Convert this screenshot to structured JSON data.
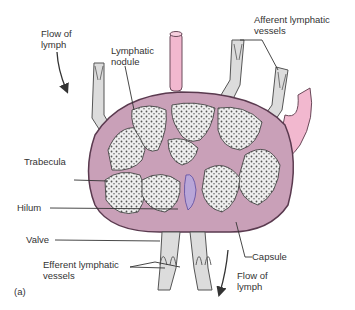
{
  "figure": {
    "panel_label": "(a)",
    "colors": {
      "capsule": "#c9a0b8",
      "capsule_outline": "#5a3a4f",
      "vessel_pink": "#f2b8cf",
      "vessel_gray": "#dcdcdc",
      "nodule_fill": "#eeeeee",
      "nodule_texture": "#444444",
      "vein_blue": "#7a6fc0"
    }
  },
  "labels": {
    "flow_top": "Flow of\nlymph",
    "lymphatic_nodule": "Lymphatic\nnodule",
    "afferent_vessels": "Afferent lymphatic\nvessels",
    "trabecula": "Trabecula",
    "hilum": "Hilum",
    "valve": "Valve",
    "efferent_vessels": "Efferent lymphatic\nvessels",
    "capsule": "Capsule",
    "flow_bottom": "Flow of\nlymph"
  }
}
